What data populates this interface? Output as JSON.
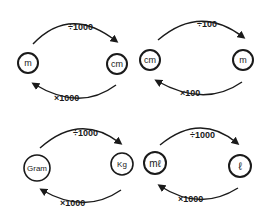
{
  "diagrams": [
    {
      "from_unit": "m",
      "to_unit": "cm",
      "top_arrow_label": "÷1000",
      "bottom_arrow_label": "×1000"
    },
    {
      "from_unit": "cm",
      "to_unit": "m",
      "top_arrow_label": "÷100",
      "bottom_arrow_label": "×100"
    },
    {
      "from_unit": "Gram",
      "to_unit": "Kg",
      "top_arrow_label": "÷1000",
      "bottom_arrow_label": "×1000"
    },
    {
      "from_unit": "mℓ",
      "to_unit": "ℓ",
      "top_arrow_label": "÷1000",
      "bottom_arrow_label": "×1000"
    }
  ],
  "colors": {
    "ink": "#1a1a1a",
    "background": "#ffffff"
  }
}
